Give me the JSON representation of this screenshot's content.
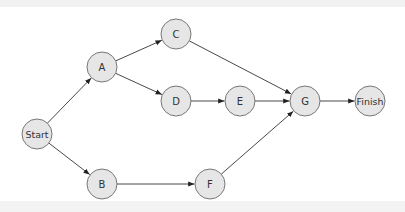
{
  "diagram": {
    "type": "network-flow",
    "nodes": [
      {
        "id": "start",
        "label": "Start",
        "x": 37,
        "y": 134,
        "r": 15
      },
      {
        "id": "A",
        "label": "A",
        "x": 102,
        "y": 67,
        "r": 15
      },
      {
        "id": "C",
        "label": "C",
        "x": 176,
        "y": 34,
        "r": 15
      },
      {
        "id": "D",
        "label": "D",
        "x": 176,
        "y": 101,
        "r": 15
      },
      {
        "id": "E",
        "label": "E",
        "x": 240,
        "y": 101,
        "r": 15
      },
      {
        "id": "G",
        "label": "G",
        "x": 305,
        "y": 101,
        "r": 15
      },
      {
        "id": "finish",
        "label": "Finish",
        "x": 370,
        "y": 101,
        "r": 15
      },
      {
        "id": "B",
        "label": "B",
        "x": 102,
        "y": 184,
        "r": 15
      },
      {
        "id": "F",
        "label": "F",
        "x": 210,
        "y": 184,
        "r": 15
      }
    ],
    "edges": [
      {
        "from": "start",
        "to": "A"
      },
      {
        "from": "start",
        "to": "B"
      },
      {
        "from": "A",
        "to": "C"
      },
      {
        "from": "A",
        "to": "D"
      },
      {
        "from": "C",
        "to": "G"
      },
      {
        "from": "D",
        "to": "E"
      },
      {
        "from": "E",
        "to": "G"
      },
      {
        "from": "B",
        "to": "F"
      },
      {
        "from": "F",
        "to": "G"
      },
      {
        "from": "G",
        "to": "finish"
      }
    ]
  },
  "colors": {
    "node_fill": "#e6e6e6",
    "node_stroke": "#777777",
    "edge": "#333333",
    "text": "#333333"
  }
}
